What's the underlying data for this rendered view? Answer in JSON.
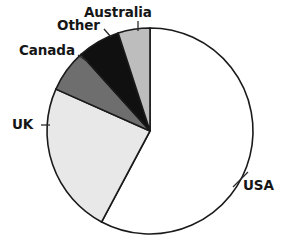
{
  "chart_data": {
    "type": "pie",
    "title": "",
    "subtitle": "",
    "xlabel": "",
    "ylabel": "",
    "legend_position": "none",
    "grid": false,
    "labels_outside": true,
    "start_angle_deg": 0,
    "direction": "clockwise",
    "categories": [
      "USA",
      "UK",
      "Canada",
      "Other",
      "Australia"
    ],
    "values": [
      57.8,
      23.9,
      6.7,
      6.7,
      5.0
    ],
    "units": "percent",
    "slices": [
      {
        "label": "USA",
        "value": 57.8,
        "start_angle_deg": 0,
        "end_angle_deg": 208,
        "color": "#ffffff",
        "edge_color": "#1a1a1a"
      },
      {
        "label": "UK",
        "value": 23.9,
        "start_angle_deg": 208,
        "end_angle_deg": 294,
        "color": "#e8e8e8",
        "edge_color": "#1a1a1a"
      },
      {
        "label": "Canada",
        "value": 6.7,
        "start_angle_deg": 294,
        "end_angle_deg": 318,
        "color": "#6e6e6e",
        "edge_color": "#1a1a1a"
      },
      {
        "label": "Other",
        "value": 6.7,
        "start_angle_deg": 318,
        "end_angle_deg": 342,
        "color": "#101010",
        "edge_color": "#1a1a1a"
      },
      {
        "label": "Australia",
        "value": 5.0,
        "start_angle_deg": 342,
        "end_angle_deg": 360,
        "color": "#bdbdbd",
        "edge_color": "#1a1a1a"
      }
    ]
  },
  "labels": {
    "usa": "USA",
    "uk": "UK",
    "canada": "Canada",
    "other": "Other",
    "australia": "Australia"
  },
  "colors": {
    "background": "#ffffff",
    "outline": "#1a1a1a",
    "text": "#161616",
    "usa": "#ffffff",
    "uk": "#e8e8e8",
    "canada": "#6e6e6e",
    "other": "#101010",
    "australia": "#bdbdbd"
  }
}
